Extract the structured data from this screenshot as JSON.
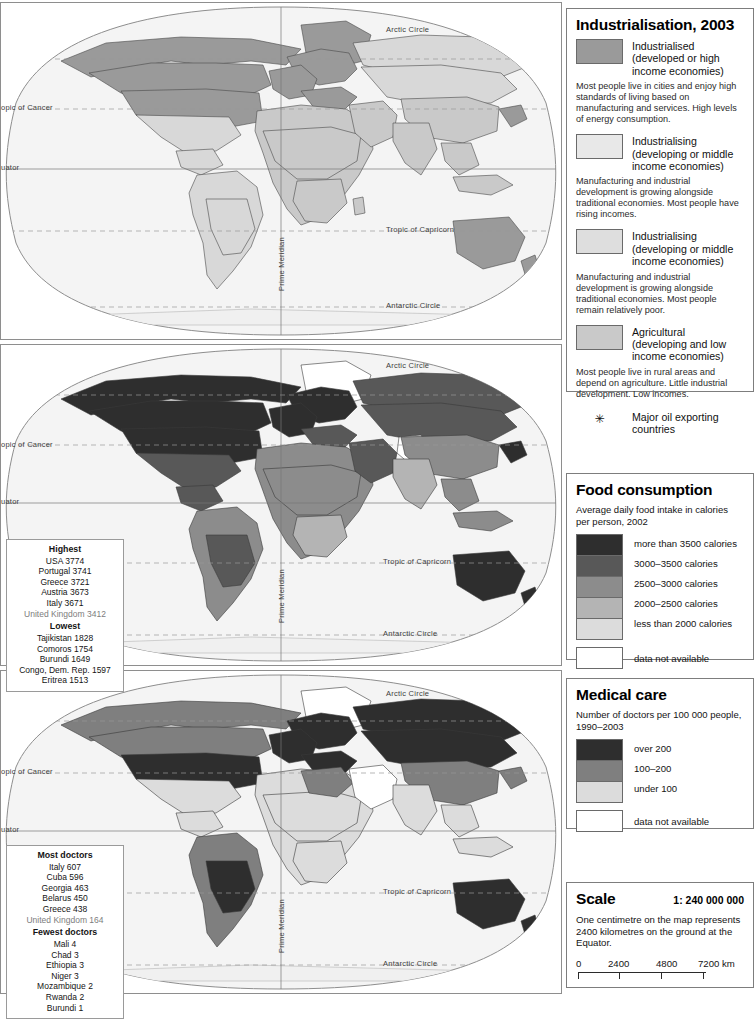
{
  "palette": {
    "industrialised": "#9a9a9a",
    "industrialising_mid_upper": "#e2e2e2",
    "industrialising_mid_lower": "#d2d2d2",
    "agricultural": "#c9c9c9",
    "food_over3500": "#2e2e2e",
    "food_3000_3500": "#585858",
    "food_2500_3000": "#8c8c8c",
    "food_2000_2500": "#b4b4b4",
    "food_under2000": "#dcdcdc",
    "med_over200": "#2e2e2e",
    "med_100_200": "#7f7f7f",
    "med_under100": "#dcdcdc",
    "no_data": "#ffffff",
    "ocean": "#f4f4f4",
    "border": "#4a4a4a"
  },
  "map_labels": {
    "arctic_circle": "Arctic Circle",
    "tropic_of_cancer": "opic of Cancer",
    "equator": "uator",
    "tropic_of_capricorn": "Tropic of Capricorn",
    "antarctic_circle": "Antarctic Circle",
    "prime_meridian": "Prime Meridian"
  },
  "industrialisation": {
    "title": "Industrialisation, 2003",
    "entries": [
      {
        "label": "Industrialised\n(developed or high\nincome economies)",
        "swatch": "#9a9a9a",
        "description": "Most people live in cities and enjoy high standards of living based on manufacturing and services. High levels of energy consumption."
      },
      {
        "label": "Industrialising\n(developing or middle\nincome economies)",
        "swatch": "#e8e8e8",
        "description": "Manufacturing and industrial development is growing alongside traditional economies. Most people have rising incomes."
      },
      {
        "label": "Industrialising\n(developing or middle\nincome economies)",
        "swatch": "#dedede",
        "description": "Manufacturing and industrial development is growing alongside traditional economies. Most people remain relatively poor."
      },
      {
        "label": "Agricultural\n(developing and low\nincome economies)",
        "swatch": "#c9c9c9",
        "description": "Most people live in rural areas and depend on agriculture. Little industrial development. Low incomes."
      }
    ],
    "oil_marker": "✳",
    "oil_label": "Major oil exporting\ncountries"
  },
  "food": {
    "title": "Food consumption",
    "subtitle": "Average daily food intake in calories per person, 2002",
    "bands": [
      {
        "label": "more than 3500 calories",
        "color": "#2e2e2e"
      },
      {
        "label": "3000–3500 calories",
        "color": "#585858"
      },
      {
        "label": "2500–3000 calories",
        "color": "#8c8c8c"
      },
      {
        "label": "2000–2500 calories",
        "color": "#b4b4b4"
      },
      {
        "label": "less than 2000 calories",
        "color": "#dcdcdc"
      }
    ],
    "no_data_label": "data not available",
    "stats": {
      "highest_heading": "Highest",
      "highest": [
        "USA 3774",
        "Portugal 3741",
        "Greece 3721",
        "Austria 3673",
        "Italy 3671"
      ],
      "uk": "United Kingdom 3412",
      "lowest_heading": "Lowest",
      "lowest": [
        "Tajikistan 1828",
        "Comoros 1754",
        "Burundi 1649",
        "Congo, Dem. Rep. 1597",
        "Eritrea 1513"
      ]
    }
  },
  "medical": {
    "title": "Medical care",
    "subtitle": "Number of doctors per 100 000 people, 1990–2003",
    "bands": [
      {
        "label": "over 200",
        "color": "#2e2e2e"
      },
      {
        "label": "100–200",
        "color": "#7f7f7f"
      },
      {
        "label": "under 100",
        "color": "#dcdcdc"
      }
    ],
    "no_data_label": "data not available",
    "stats": {
      "most_heading": "Most doctors",
      "most": [
        "Italy 607",
        "Cuba 596",
        "Georgia 463",
        "Belarus 450",
        "Greece 438"
      ],
      "uk": "United Kingdom 164",
      "fewest_heading": "Fewest doctors",
      "fewest": [
        "Mali 4",
        "Chad 3",
        "Ethiopia 3",
        "Niger 3",
        "Mozambique 2",
        "Rwanda 2",
        "Burundi 1"
      ]
    }
  },
  "scale": {
    "title": "Scale",
    "ratio": "1: 240 000 000",
    "text": "One centimetre on the map represents 2400 kilometres on the ground at the Equator.",
    "ticks": [
      "0",
      "2400",
      "4800",
      "7200 km"
    ]
  }
}
